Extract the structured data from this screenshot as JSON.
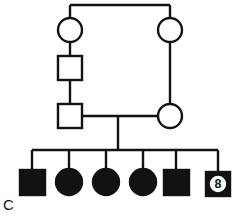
{
  "figure": {
    "panel_label": "C",
    "type": "pedigree-chart",
    "line_color": "#121212",
    "fill_affected": "#121212",
    "fill_unaffected": "#ffffff",
    "background": "#ffffff",
    "stroke_width": 2.4
  },
  "generations": [
    {
      "id": "I",
      "members": [
        {
          "id": "I-1",
          "shape": "circle",
          "sex": "female",
          "affected": false,
          "cx": 70,
          "cy": 30,
          "r": 12,
          "label": ""
        },
        {
          "id": "I-2",
          "shape": "circle",
          "sex": "female",
          "affected": false,
          "cx": 170,
          "cy": 30,
          "r": 12,
          "label": ""
        }
      ]
    },
    {
      "id": "II",
      "members": [
        {
          "id": "II-1",
          "shape": "square",
          "sex": "male",
          "affected": false,
          "cx": 70,
          "cy": 68,
          "size": 24,
          "label": ""
        }
      ]
    },
    {
      "id": "III",
      "members": [
        {
          "id": "III-1",
          "shape": "square",
          "sex": "male",
          "affected": false,
          "cx": 70,
          "cy": 116,
          "size": 24,
          "label": ""
        },
        {
          "id": "III-2",
          "shape": "circle",
          "sex": "female",
          "affected": false,
          "cx": 170,
          "cy": 116,
          "r": 12,
          "label": ""
        }
      ]
    },
    {
      "id": "IV",
      "members": [
        {
          "id": "IV-1",
          "shape": "square",
          "sex": "male",
          "affected": true,
          "cx": 32,
          "cy": 182,
          "size": 25,
          "label": ""
        },
        {
          "id": "IV-2",
          "shape": "circle",
          "sex": "female",
          "affected": true,
          "cx": 69,
          "cy": 182,
          "r": 13,
          "label": ""
        },
        {
          "id": "IV-3",
          "shape": "circle",
          "sex": "female",
          "affected": true,
          "cx": 106,
          "cy": 182,
          "r": 13,
          "label": ""
        },
        {
          "id": "IV-4",
          "shape": "circle",
          "sex": "female",
          "affected": true,
          "cx": 143,
          "cy": 182,
          "r": 13,
          "label": ""
        },
        {
          "id": "IV-5",
          "shape": "square",
          "sex": "male",
          "affected": true,
          "cx": 176,
          "cy": 182,
          "size": 25,
          "label": ""
        },
        {
          "id": "IV-6",
          "shape": "square",
          "sex": "male",
          "affected": true,
          "cx": 218,
          "cy": 184,
          "size": 24,
          "label": "8",
          "count_badge": true
        }
      ]
    }
  ],
  "connectors": {
    "gen1_mating_line_y": 5,
    "gen1_mating_line_x1": 70,
    "gen1_mating_line_x2": 170,
    "gen3_mating_line_y": 116,
    "sibship_line_y": 150,
    "sibship_line_x1": 32,
    "sibship_line_x2": 218,
    "descent_x": 118
  }
}
